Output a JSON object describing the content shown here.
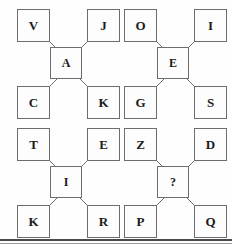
{
  "page": {
    "background_color": "#fefefe",
    "box_border_color": "#6d6d6d",
    "box_fill_color": "#fdfdfd",
    "text_color": "#1b1b1b",
    "connector_color": "#6d6d6d",
    "divider_color": "#4a4a4a",
    "top_crop_remnant": "",
    "missing_value_marker": "?"
  },
  "diagram_data": {
    "type": "diagram",
    "layout": "2x2 grid of letter groups; each group has four corner boxes and one center box joined by diagonal connectors",
    "group_count": 4,
    "groups": [
      {
        "index": 0,
        "position": "top-left",
        "top_left": "V",
        "top_right": "J",
        "bottom_left": "C",
        "bottom_right": "K",
        "center": "A",
        "center_is_unknown": false
      },
      {
        "index": 1,
        "position": "top-right",
        "top_left": "O",
        "top_right": "I",
        "bottom_left": "G",
        "bottom_right": "S",
        "center": "E",
        "center_is_unknown": false
      },
      {
        "index": 2,
        "position": "bottom-left",
        "top_left": "T",
        "top_right": "E",
        "bottom_left": "K",
        "bottom_right": "R",
        "center": "I",
        "center_is_unknown": false
      },
      {
        "index": 3,
        "position": "bottom-right",
        "top_left": "Z",
        "top_right": "D",
        "bottom_left": "P",
        "bottom_right": "Q",
        "center": "?",
        "center_is_unknown": true
      }
    ]
  }
}
